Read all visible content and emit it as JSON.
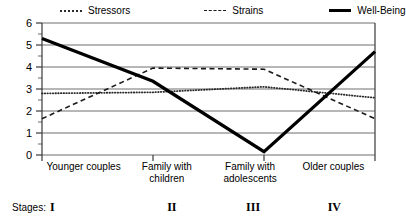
{
  "legend": {
    "items": [
      {
        "label": "Stressors",
        "style": "dotted",
        "color": "#2a2a2a",
        "name": "legend-stressors"
      },
      {
        "label": "Strains",
        "style": "dashed",
        "color": "#1a1a1a",
        "name": "legend-strains"
      },
      {
        "label": "Well-Being",
        "style": "solid",
        "color": "#000000",
        "name": "legend-well-being"
      }
    ]
  },
  "axis": {
    "y_ticks": [
      "0",
      "1",
      "2",
      "3",
      "4",
      "5",
      "6"
    ],
    "y_tick_6": "6",
    "y_tick_5": "5",
    "y_tick_4": "4",
    "y_tick_3": "3",
    "y_tick_2": "2",
    "y_tick_1": "1",
    "y_tick_0": "0"
  },
  "x_labels": [
    "Younger couples",
    "Family with children",
    "Family with adolescents",
    "Older couples"
  ],
  "stages": {
    "caption": "Stages:",
    "values": [
      "I",
      "II",
      "III",
      "IV"
    ]
  },
  "chart_data": {
    "type": "line",
    "title": "",
    "xlabel": "",
    "ylabel": "",
    "ylim": [
      0,
      6
    ],
    "grid": true,
    "legend_position": "top",
    "categories": [
      "Younger couples",
      "Family with children",
      "Family with adolescents",
      "Older couples"
    ],
    "stage_labels": [
      "I",
      "II",
      "III",
      "IV"
    ],
    "series": [
      {
        "name": "Stressors",
        "style": "dotted",
        "color": "#2a2a2a",
        "values": [
          2.8,
          2.85,
          3.1,
          2.6
        ]
      },
      {
        "name": "Strains",
        "style": "dashed",
        "color": "#1a1a1a",
        "values": [
          1.65,
          3.95,
          3.9,
          1.65
        ]
      },
      {
        "name": "Well-Being",
        "style": "solid",
        "color": "#000000",
        "values": [
          5.3,
          3.35,
          0.15,
          4.7
        ]
      }
    ]
  }
}
